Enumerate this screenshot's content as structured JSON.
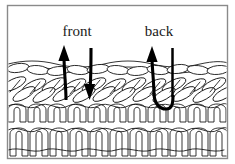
{
  "figure": {
    "border_color": "#8a8a8a",
    "background_color": "#ffffff",
    "ink_color": "#111111",
    "arrow_color": "#000000",
    "width": 235,
    "height": 164
  },
  "labels": [
    {
      "id": "front",
      "text": "front",
      "x": 77,
      "y": 36
    },
    {
      "id": "back",
      "text": "back",
      "x": 159,
      "y": 36
    }
  ],
  "arrows": [
    {
      "id": "front-up-arrow",
      "name": "front-needle-up-arrow",
      "direction": "up",
      "has_head": true,
      "head_x": 64,
      "head_tip_y": 46,
      "tail_y": 100
    },
    {
      "id": "front-down-arrow",
      "name": "front-needle-down-arrow",
      "direction": "down",
      "has_head": true,
      "head_x": 91,
      "head_tip_y": 99,
      "tail_y": 48
    },
    {
      "id": "back-up-arrow",
      "name": "back-needle-up-arrow",
      "direction": "up",
      "has_head": true,
      "head_x": 152,
      "head_tip_y": 47,
      "tail_y": 100
    },
    {
      "id": "back-stem",
      "name": "back-needle-stem",
      "direction": "down",
      "has_head": false,
      "head_x": 172,
      "head_tip_y": 98,
      "tail_y": 48
    }
  ],
  "fabric": {
    "name": "knit-fabric-swatch",
    "top_y": 62,
    "bottom_y": 155,
    "row_count": 4,
    "columns_per_row": 11,
    "rows": [
      {
        "id": "row-top-flat",
        "type": "flat-loops",
        "y": 68
      },
      {
        "id": "row-diagonal-upper",
        "type": "diagonal-loops",
        "y": 88
      },
      {
        "id": "row-arch",
        "type": "arch-loops",
        "y": 112
      },
      {
        "id": "row-column",
        "type": "column-loops",
        "y": 136
      }
    ]
  }
}
